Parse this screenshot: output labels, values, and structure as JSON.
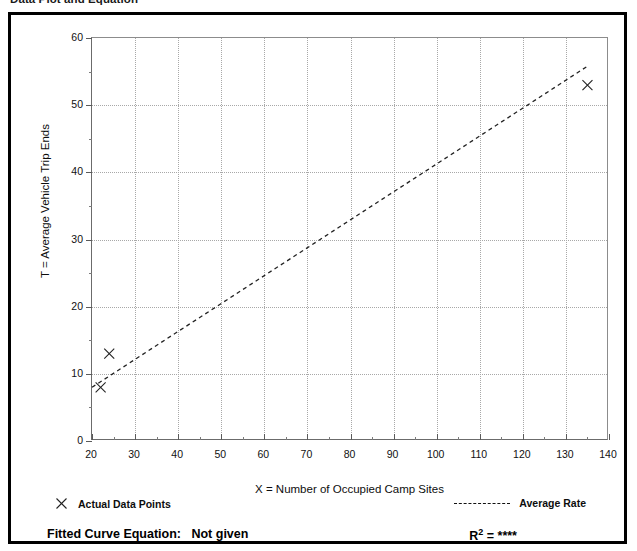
{
  "page": {
    "heading": "Data Plot and Equation",
    "heading_right": ""
  },
  "figure": {
    "legend": {
      "points_marker": "x-marker-icon",
      "points_label": "Actual Data Points",
      "rate_marker": "dashed-line-icon",
      "rate_label": "Average Rate"
    },
    "footer": {
      "fitted_curve_label": "Fitted Curve Equation:",
      "fitted_curve_value": "Not given",
      "r_squared_label": "R",
      "r_squared_exponent": "2",
      "r_squared_equals": "=",
      "r_squared_value": "****"
    }
  },
  "chart_data": {
    "type": "scatter",
    "title": "",
    "xlabel": "X = Number of Occupied Camp Sites",
    "ylabel": "T = Average Vehicle Trip Ends",
    "xlim": [
      20,
      140
    ],
    "ylim": [
      0,
      60
    ],
    "xticks": [
      20,
      30,
      40,
      50,
      60,
      70,
      80,
      90,
      100,
      110,
      120,
      130,
      140
    ],
    "yticks": [
      0,
      10,
      20,
      30,
      40,
      50,
      60
    ],
    "x_minor_step": 5,
    "y_minor_step": 5,
    "grid": true,
    "legend_position": "below-plot",
    "series": [
      {
        "name": "Actual Data Points",
        "type": "scatter",
        "marker": "x",
        "points": [
          {
            "x": 22,
            "y": 8
          },
          {
            "x": 24,
            "y": 13
          },
          {
            "x": 135,
            "y": 53
          }
        ]
      },
      {
        "name": "Average Rate",
        "type": "line",
        "style": "dashed",
        "points": [
          {
            "x": 20,
            "y": 8.0
          },
          {
            "x": 135,
            "y": 55.8
          }
        ]
      }
    ]
  }
}
